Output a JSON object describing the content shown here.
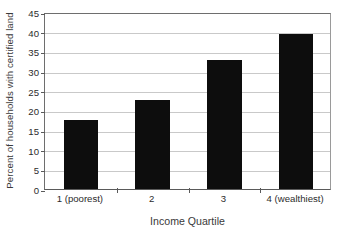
{
  "chart_data": {
    "type": "bar",
    "title": "",
    "subtitle": "",
    "xlabel": "Income Quartile",
    "ylabel": "Percent of households with certified land",
    "categories": [
      "1 (poorest)",
      "2",
      "3",
      "4 (wealthiest)"
    ],
    "values": [
      17.5,
      22.6,
      32.7,
      39.3
    ],
    "ylim": [
      0,
      45
    ],
    "ytick_step": 5,
    "yticks": [
      0,
      5,
      10,
      15,
      20,
      25,
      30,
      35,
      40,
      45
    ],
    "ytick_labels": [
      "0",
      "5",
      "10",
      "15",
      "20",
      "25",
      "30",
      "35",
      "40",
      "45"
    ],
    "grid": "horizontal",
    "legend": "none",
    "bar_color": "#0d0d0d",
    "gridline_color": "#c9c9c9",
    "axis_color": "#5a5a5a",
    "background_color": "#ffffff",
    "annotations": []
  },
  "axes": {
    "y_title": "Percent of households with certified land",
    "x_title": "Income Quartile"
  }
}
